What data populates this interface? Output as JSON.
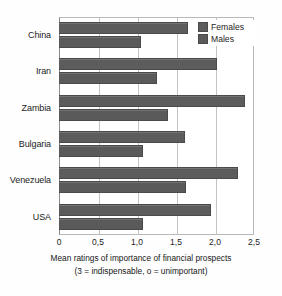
{
  "chart_data": {
    "type": "bar",
    "orientation": "horizontal",
    "title": "",
    "xlabel": "Mean ratings of importance of financial prospects",
    "xlabel_line2": "(3 = indispensable, o = unimportant)",
    "ylabel": "",
    "categories": [
      "China",
      "Iran",
      "Zambia",
      "Bulgaria",
      "Venezuela",
      "USA"
    ],
    "series": [
      {
        "name": "Females",
        "values": [
          1.65,
          2.02,
          2.38,
          1.62,
          2.3,
          1.95
        ],
        "color": "#5c5c5c"
      },
      {
        "name": "Males",
        "values": [
          1.05,
          1.25,
          1.4,
          1.08,
          1.63,
          1.08
        ],
        "color": "#5a5a5a"
      }
    ],
    "xlim": [
      0,
      2.5
    ],
    "xticks": [
      0,
      0.5,
      1.0,
      1.5,
      2.0,
      2.5
    ],
    "xtick_labels": [
      "0",
      "0,5",
      "1,0",
      "1,5",
      "2,0",
      "2,5"
    ],
    "grid": true,
    "grid_axis": "x",
    "legend_position": "top-right",
    "legend_entries": [
      "Females",
      "Males"
    ]
  }
}
